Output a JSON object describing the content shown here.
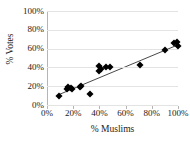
{
  "chart_data": {
    "type": "scatter",
    "title": "",
    "xlabel": "% Muslims",
    "ylabel": "% Votes",
    "xlim": [
      0,
      100
    ],
    "ylim": [
      0,
      100
    ],
    "grid": true,
    "legend": false,
    "x_ticks": [
      "0%",
      "20%",
      "40%",
      "60%",
      "80%",
      "100%"
    ],
    "x_tick_values": [
      0,
      20,
      40,
      60,
      80,
      100
    ],
    "y_ticks": [
      "0%",
      "20%",
      "40%",
      "60%",
      "80%",
      "100%"
    ],
    "y_tick_values": [
      0,
      20,
      40,
      60,
      80,
      100
    ],
    "marker": "diamond",
    "marker_color": "#000000",
    "gridline_color": "#e3e3e3",
    "axis_color": "#b5b5b5",
    "points": [
      {
        "x": 9,
        "y": 10
      },
      {
        "x": 15,
        "y": 17
      },
      {
        "x": 16,
        "y": 19
      },
      {
        "x": 18,
        "y": 18
      },
      {
        "x": 19,
        "y": 17
      },
      {
        "x": 25,
        "y": 19
      },
      {
        "x": 26,
        "y": 20
      },
      {
        "x": 33,
        "y": 12
      },
      {
        "x": 40,
        "y": 36
      },
      {
        "x": 40,
        "y": 42
      },
      {
        "x": 41,
        "y": 38
      },
      {
        "x": 45,
        "y": 40
      },
      {
        "x": 48,
        "y": 40
      },
      {
        "x": 71,
        "y": 43
      },
      {
        "x": 90,
        "y": 59
      },
      {
        "x": 97,
        "y": 66
      },
      {
        "x": 99,
        "y": 67
      },
      {
        "x": 100,
        "y": 63
      }
    ],
    "trend_line": {
      "type": "linear",
      "x_start": 9,
      "y_start": 11,
      "x_end": 100,
      "y_end": 64,
      "color": "#333333"
    }
  }
}
